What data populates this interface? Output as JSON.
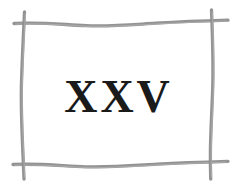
{
  "image": {
    "kind": "scanned-illustration",
    "background_color": "#ffffff",
    "width": 241,
    "height": 189
  },
  "frame": {
    "name": "hand-drawn-rectangular-border",
    "style": "rough hand-drawn pencil/crayon strokes, four separate lines crossing past each other at the corners",
    "stroke_color": "#8d8d8d",
    "stroke_color_light": "#a6a6a6",
    "stroke_width": 3.2,
    "sides": [
      {
        "name": "top-stroke",
        "orientation": "horizontal"
      },
      {
        "name": "bottom-stroke",
        "orientation": "horizontal"
      },
      {
        "name": "left-stroke",
        "orientation": "vertical"
      },
      {
        "name": "right-stroke",
        "orientation": "vertical"
      }
    ]
  },
  "content": {
    "numeral": "XXV",
    "numeral_value": "25",
    "numeral_system": "roman",
    "text_color": "#1a1a1a"
  }
}
